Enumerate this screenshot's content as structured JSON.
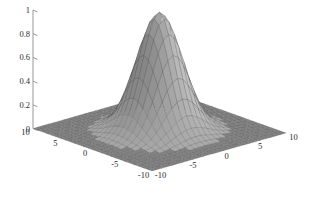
{
  "figure": {
    "title": "",
    "background_color": "#ffffff",
    "width": 315,
    "height": 206
  },
  "chart_data": {
    "type": "surface",
    "title": "",
    "xlabel": "",
    "ylabel": "",
    "zlabel": "",
    "function": "gaussian bell",
    "xlim": [
      -10,
      10
    ],
    "ylim": [
      -10,
      10
    ],
    "zlim": [
      0,
      1
    ],
    "peak_value": 1.0,
    "peak_location": [
      0,
      0
    ],
    "sigma": 2.6,
    "grid_on": false,
    "legend": "none",
    "colormap": "gray",
    "shading": "faceted",
    "mesh_steps": 26,
    "x_ticks": [
      -10,
      -5,
      0,
      5,
      10
    ],
    "x_tick_labels": [
      "-10",
      "-5",
      "0",
      "5",
      "10"
    ],
    "y_ticks": [
      -10,
      -5,
      0,
      5,
      10
    ],
    "y_tick_labels": [
      "-10",
      "-5",
      "0",
      "5",
      "10"
    ],
    "z_ticks": [
      0,
      0.2,
      0.4,
      0.6,
      0.8,
      1
    ],
    "z_tick_labels": [
      "0",
      "0.2",
      "0.4",
      "0.6",
      "0.8",
      "1"
    ],
    "view_azimuth": -37.5,
    "view_elevation": 30,
    "sample_profile_y0": {
      "x": [
        -10,
        -8,
        -6,
        -4,
        -2,
        0,
        2,
        4,
        6,
        8,
        10
      ],
      "z": [
        0.0,
        0.01,
        0.07,
        0.29,
        0.75,
        1.0,
        0.75,
        0.29,
        0.07,
        0.01,
        0.0
      ]
    }
  },
  "axes": {
    "z_axis": {
      "name": "z-axis",
      "labels": [
        "1",
        "0.8",
        "0.6",
        "0.4",
        "0.2",
        "0"
      ]
    },
    "y_axis": {
      "name": "y-axis-left",
      "labels": [
        "10",
        "5",
        "0",
        "-5",
        "-10"
      ]
    },
    "x_axis": {
      "name": "x-axis-right",
      "labels": [
        "-10",
        "-5",
        "0",
        "5",
        "10"
      ]
    }
  },
  "colors": {
    "axis": "#8d8d8d",
    "text": "#2b2b2b",
    "base_plane_dark": "#5a5a5a",
    "surface_light": "#f2f2f2",
    "surface_dark": "#4a4a4a",
    "mesh_line": "#3c3c3c"
  }
}
